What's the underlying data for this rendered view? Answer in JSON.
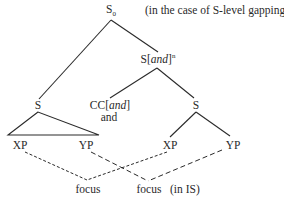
{
  "diagram": {
    "note": "(in the case of S-level gapping)",
    "nodes": {
      "root": {
        "label": "S",
        "sub": "0"
      },
      "conj_phrase": {
        "label_pre": "S[",
        "label_italic": "and",
        "label_post": "]",
        "sup": "n"
      },
      "left_s": {
        "label": "S"
      },
      "cc": {
        "label_pre": "CC[",
        "label_italic": "and",
        "label_post": "]",
        "word": "and"
      },
      "right_s": {
        "label": "S"
      },
      "left_xp": {
        "label": "XP"
      },
      "left_yp": {
        "label": "YP"
      },
      "right_xp": {
        "label": "XP"
      },
      "right_yp": {
        "label": "YP"
      }
    },
    "focus_left": "focus",
    "focus_right": "focus",
    "focus_right_note": "(in IS)",
    "colors": {
      "line": "#2a2a2a",
      "text": "#2a2a2a",
      "background": "#ffffff"
    }
  }
}
